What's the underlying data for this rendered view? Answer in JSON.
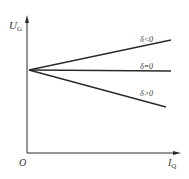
{
  "diagram": {
    "axes": {
      "y_label": "U",
      "y_label_sub": "G",
      "x_label": "I",
      "x_label_sub": "Q",
      "origin_label": "O"
    },
    "lines": [
      {
        "label": "δ<0",
        "trend": "rising"
      },
      {
        "label": "δ=0",
        "trend": "flat"
      },
      {
        "label": "δ>0",
        "trend": "falling"
      }
    ],
    "colors": {
      "stroke": "#2a2a2a",
      "background": "#ffffff"
    }
  }
}
